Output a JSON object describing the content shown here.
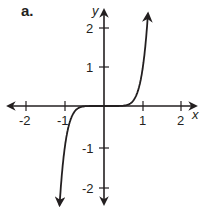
{
  "panel": {
    "label": "a."
  },
  "chart_data": {
    "type": "line",
    "title": "",
    "function_description": "odd power curve, approx y = x^7 (passes through (-1,-1), (0,0), (1,1))",
    "xlabel": "x",
    "ylabel": "y",
    "xlim": [
      -2.5,
      2.5
    ],
    "ylim": [
      -2.5,
      2.5
    ],
    "x_ticks": [
      -2,
      -1,
      1,
      2
    ],
    "x_tick_labels": [
      "-2",
      "-1",
      "1",
      "2"
    ],
    "y_ticks": [
      -2,
      -1,
      1,
      2
    ],
    "y_tick_labels": [
      "-2",
      "-1",
      "1",
      "2"
    ],
    "grid": false,
    "legend": false,
    "series": [
      {
        "name": "f(x)",
        "color": "#231f20",
        "x": [
          -1.15,
          -1.1,
          -1.05,
          -1.0,
          -0.95,
          -0.9,
          -0.8,
          -0.7,
          -0.5,
          0,
          0.5,
          0.7,
          0.8,
          0.9,
          0.95,
          1.0,
          1.05,
          1.1,
          1.15
        ],
        "y": [
          -2.66,
          -1.95,
          -1.41,
          -1.0,
          -0.7,
          -0.48,
          -0.21,
          -0.08,
          -0.01,
          0,
          0.01,
          0.08,
          0.21,
          0.48,
          0.7,
          1.0,
          1.41,
          1.95,
          2.66
        ]
      }
    ]
  }
}
